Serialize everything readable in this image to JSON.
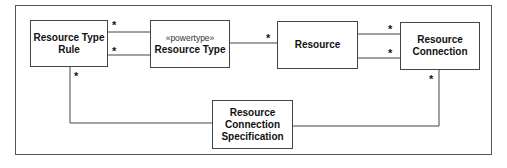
{
  "diagram": {
    "type": "uml-class-diagram",
    "classes": [
      {
        "id": "resource_type_rule",
        "name_line1": "Resource Type",
        "name_line2": "Rule"
      },
      {
        "id": "resource_type",
        "stereotype": "«powertype»",
        "name": "Resource Type"
      },
      {
        "id": "resource",
        "name": "Resource"
      },
      {
        "id": "resource_connection",
        "name_line1": "Resource",
        "name_line2": "Connection"
      },
      {
        "id": "resource_connection_specification",
        "name_line1": "Resource",
        "name_line2": "Connection",
        "name_line3": "Specification"
      }
    ],
    "associations": [
      {
        "from": "resource_type_rule",
        "to": "resource_type",
        "multiplicity_near_rule": "*"
      },
      {
        "from": "resource_type_rule",
        "to": "resource_type",
        "multiplicity_near_rule": "*"
      },
      {
        "from": "resource_type",
        "to": "resource",
        "multiplicity_near_resource": "*"
      },
      {
        "from": "resource",
        "to": "resource_connection",
        "multiplicity_near_connection": "*"
      },
      {
        "from": "resource",
        "to": "resource_connection",
        "multiplicity_near_connection": "*"
      },
      {
        "from": "resource_type_rule",
        "to": "resource_connection_specification",
        "multiplicity_near_rule": "*"
      },
      {
        "from": "resource_connection",
        "to": "resource_connection_specification",
        "multiplicity_near_connection": "*"
      }
    ],
    "multiplicity_symbol": "*"
  }
}
